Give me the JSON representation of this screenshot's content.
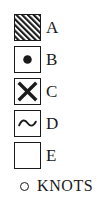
{
  "legend": {
    "title": "",
    "stroke_color": "#1a1a1a",
    "fill_color": "#ffffff",
    "rows": [
      {
        "label": "A",
        "symbol": "diagonal-hatch-square-icon"
      },
      {
        "label": "B",
        "symbol": "dot-square-icon"
      },
      {
        "label": "C",
        "symbol": "cross-x-square-icon"
      },
      {
        "label": "D",
        "symbol": "wave-tilde-square-icon"
      },
      {
        "label": "E",
        "symbol": "empty-square-icon"
      }
    ]
  },
  "units": {
    "symbol": "open-circle-icon",
    "text": "KNOTS"
  }
}
